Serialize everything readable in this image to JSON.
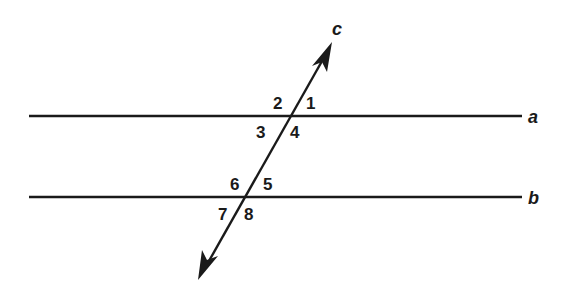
{
  "diagram": {
    "colors": {
      "line": "#1a1a1a",
      "background": "#ffffff"
    },
    "lines": [
      {
        "id": "a",
        "label": "a",
        "type": "parallel",
        "x1": 29,
        "y1": 116,
        "x2": 522,
        "y2": 116
      },
      {
        "id": "b",
        "label": "b",
        "type": "parallel",
        "x1": 29,
        "y1": 197,
        "x2": 522,
        "y2": 197
      },
      {
        "id": "c",
        "label": "c",
        "type": "transversal",
        "x1": 200,
        "y1": 277,
        "x2": 331,
        "y2": 45,
        "arrows": "both"
      }
    ],
    "line_labels": {
      "a": "a",
      "b": "b",
      "c": "c"
    },
    "angles": {
      "1": "1",
      "2": "2",
      "3": "3",
      "4": "4",
      "5": "5",
      "6": "6",
      "7": "7",
      "8": "8"
    }
  }
}
